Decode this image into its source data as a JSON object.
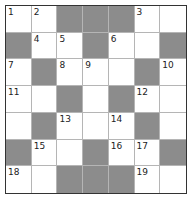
{
  "puzzle": {
    "rows": 7,
    "cols": 7,
    "colors": {
      "black_square": "#8c8c8c",
      "white_square": "#ffffff",
      "border": "#333333",
      "gridline": "#b5b5b5"
    },
    "grid": [
      [
        {
          "n": "1"
        },
        {
          "n": "2"
        },
        {
          "b": true
        },
        {
          "b": true
        },
        {
          "b": true
        },
        {
          "n": "3"
        },
        {}
      ],
      [
        {
          "b": true
        },
        {
          "n": "4"
        },
        {
          "n": "5"
        },
        {
          "b": true
        },
        {
          "n": "6"
        },
        {},
        {
          "b": true
        }
      ],
      [
        {
          "n": "7"
        },
        {
          "b": true
        },
        {
          "n": "8"
        },
        {
          "n": "9"
        },
        {},
        {
          "b": true
        },
        {
          "n": "10"
        }
      ],
      [
        {
          "n": "11"
        },
        {},
        {
          "b": true
        },
        {},
        {
          "b": true
        },
        {
          "n": "12"
        },
        {}
      ],
      [
        {},
        {
          "b": true
        },
        {
          "n": "13"
        },
        {},
        {
          "n": "14"
        },
        {
          "b": true
        },
        {}
      ],
      [
        {
          "b": true
        },
        {
          "n": "15"
        },
        {},
        {
          "b": true
        },
        {
          "n": "16"
        },
        {
          "n": "17"
        },
        {
          "b": true
        }
      ],
      [
        {
          "n": "18"
        },
        {},
        {
          "b": true
        },
        {
          "b": true
        },
        {
          "b": true
        },
        {
          "n": "19"
        },
        {}
      ]
    ]
  }
}
